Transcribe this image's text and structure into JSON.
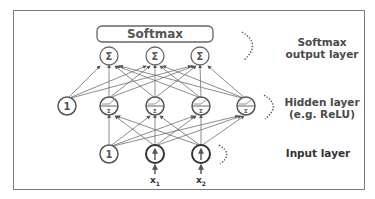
{
  "diagram": {
    "title_box": "Softmax",
    "layers": [
      {
        "id": "output",
        "label_line1": "Softmax",
        "label_line2": "output layer",
        "nodes": [
          "Σ",
          "Σ",
          "Σ"
        ]
      },
      {
        "id": "hidden",
        "label_line1": "Hidden layer",
        "label_line2": "(e.g. ReLU)",
        "bias": "1",
        "nodes": [
          "ReLU-Σ",
          "ReLU-Σ",
          "ReLU-Σ",
          "ReLU-Σ"
        ]
      },
      {
        "id": "input",
        "label_line1": "Input layer",
        "bias": "1",
        "nodes": [
          "x1",
          "x2"
        ]
      }
    ],
    "input_labels": {
      "x1": "x",
      "x1_sub": "1",
      "x2": "x",
      "x2_sub": "2"
    },
    "node_symbols": {
      "sum": "Σ",
      "bias": "1"
    },
    "colors": {
      "stroke": "#555555",
      "edge": "#6a6a6a",
      "text": "#4a4a4a",
      "frame": "#7a7a7a"
    }
  }
}
